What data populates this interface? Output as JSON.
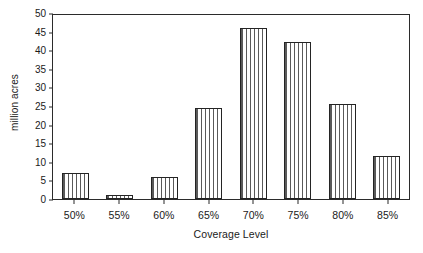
{
  "chart_data": {
    "type": "bar",
    "title": "",
    "xlabel": "Coverage Level",
    "ylabel": "million acres",
    "categories": [
      "50%",
      "55%",
      "60%",
      "65%",
      "70%",
      "75%",
      "80%",
      "85%"
    ],
    "values": [
      7.0,
      1.2,
      6.0,
      24.5,
      46.0,
      42.3,
      25.6,
      11.5
    ],
    "ylim": [
      0,
      50
    ],
    "yticks": [
      0,
      5,
      10,
      15,
      20,
      25,
      30,
      35,
      40,
      45,
      50
    ],
    "ytick_labels": [
      "0",
      "5",
      "10",
      "15",
      "20",
      "25",
      "30",
      "35",
      "40",
      "45",
      "50"
    ],
    "grid": false,
    "legend": false,
    "legend_position": "none",
    "bar_fill": "vertical-hatch",
    "bar_edge_color": "#242424",
    "axis_color": "#2b2b2b",
    "background_color": "#ffffff"
  }
}
